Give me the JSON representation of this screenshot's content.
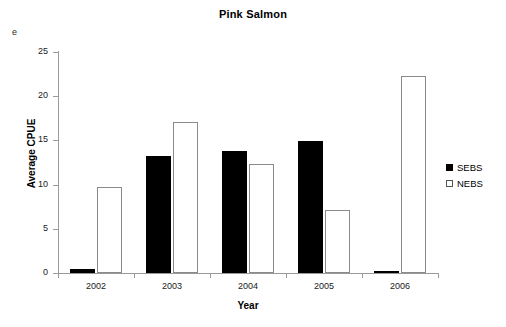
{
  "panel": {
    "label": "e"
  },
  "legend": {
    "position": "right",
    "entries": [
      {
        "name": "SEBS",
        "swatch": "filled-black-square"
      },
      {
        "name": "NEBS",
        "swatch": "open-white-square"
      }
    ]
  },
  "chart_data": {
    "type": "bar",
    "title": "Pink Salmon",
    "xlabel": "Year",
    "ylabel": "Average CPUE",
    "categories": [
      "2002",
      "2003",
      "2004",
      "2005",
      "2006"
    ],
    "series": [
      {
        "name": "SEBS",
        "color": "#000000",
        "values": [
          0.45,
          13.2,
          13.8,
          14.9,
          0.15
        ]
      },
      {
        "name": "NEBS",
        "color": "#ffffff",
        "values": [
          9.7,
          17.1,
          12.3,
          7.1,
          22.3
        ]
      }
    ],
    "ylim": [
      0,
      25
    ],
    "yticks": [
      0,
      5,
      10,
      15,
      20,
      25
    ],
    "ytick_labels": [
      "0",
      "5",
      "10",
      "15",
      "20",
      "25"
    ],
    "grid": false,
    "legend_position": "right"
  }
}
